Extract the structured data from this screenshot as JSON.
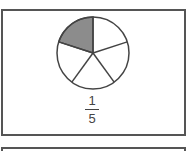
{
  "figure": {
    "shape": "circle",
    "total_parts": 5,
    "shaded_parts": 1,
    "shaded_color": "#8c8c8c",
    "unshaded_color": "#ffffff",
    "stroke_color": "#444444"
  },
  "fraction": {
    "numerator": "1",
    "denominator": "5"
  }
}
